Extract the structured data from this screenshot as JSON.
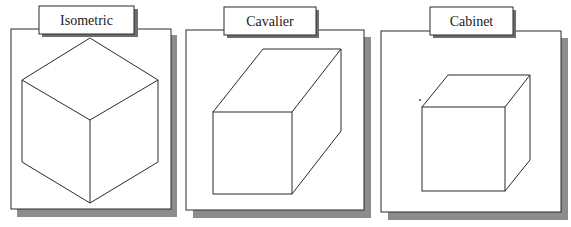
{
  "figure": {
    "stroke_color": "#2a2a2a",
    "shadow_color": "#8c8c8c",
    "background": "#ffffff"
  },
  "panels": [
    {
      "label": "Isometric"
    },
    {
      "label": "Cavalier"
    },
    {
      "label": "Cabinet"
    }
  ]
}
